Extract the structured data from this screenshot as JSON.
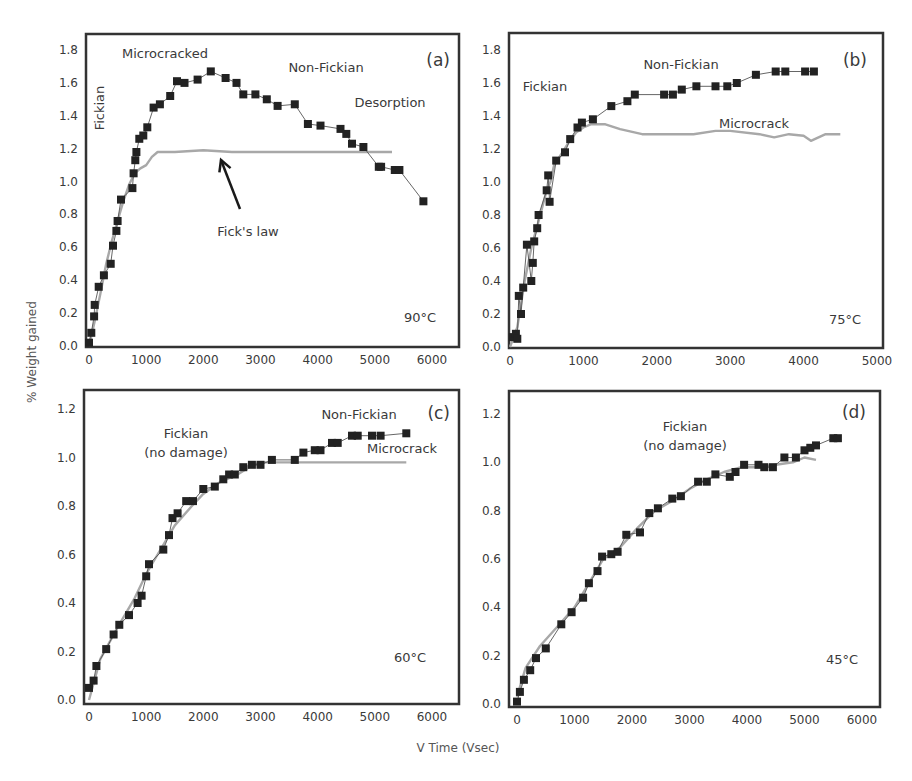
{
  "figure": {
    "ylabel": "% Weight gained",
    "xlabel": "V Time (Vsec)",
    "colors": {
      "data": "#222222",
      "fit": "#a8a8a8",
      "frame": "#333333",
      "text": "#3a3a3a"
    }
  },
  "chart_data": [
    {
      "type": "line",
      "panel": "(a)",
      "temperature": "90°C",
      "xlim": [
        0,
        6000
      ],
      "ylim": [
        0,
        1.8
      ],
      "xticks": [
        0,
        1000,
        2000,
        3000,
        4000,
        5000,
        6000
      ],
      "yticks": [
        0.0,
        0.2,
        0.4,
        0.6,
        0.8,
        1.0,
        1.2,
        1.4,
        1.6,
        1.8
      ],
      "annotations": [
        "Microcracked",
        "Non-Fickian",
        "Desorption",
        "Fickian",
        "Fick's law"
      ],
      "series": [
        {
          "name": "Experimental",
          "marker": "square",
          "x": [
            0,
            40,
            90,
            100,
            170,
            260,
            380,
            420,
            480,
            500,
            560,
            760,
            780,
            810,
            830,
            880,
            950,
            1020,
            1130,
            1240,
            1420,
            1540,
            1670,
            1900,
            2130,
            2390,
            2580,
            2700,
            2910,
            3110,
            3300,
            3600,
            3830,
            4050,
            4400,
            4500,
            4600,
            4800,
            5070,
            5110,
            5350,
            5430,
            5850
          ],
          "y": [
            0.02,
            0.08,
            0.18,
            0.25,
            0.36,
            0.43,
            0.5,
            0.61,
            0.7,
            0.76,
            0.89,
            0.96,
            1.05,
            1.13,
            1.18,
            1.26,
            1.28,
            1.33,
            1.45,
            1.47,
            1.52,
            1.61,
            1.6,
            1.62,
            1.67,
            1.63,
            1.6,
            1.53,
            1.53,
            1.5,
            1.46,
            1.47,
            1.35,
            1.34,
            1.32,
            1.29,
            1.23,
            1.21,
            1.09,
            1.09,
            1.07,
            1.07,
            0.88
          ]
        },
        {
          "name": "Fick's law",
          "marker": "none",
          "x": [
            0,
            100,
            200,
            300,
            400,
            500,
            600,
            700,
            800,
            900,
            1000,
            1100,
            1200,
            1500,
            2000,
            2500,
            3000,
            4000,
            5000,
            5300
          ],
          "y": [
            0.0,
            0.15,
            0.32,
            0.5,
            0.64,
            0.76,
            0.88,
            0.98,
            1.05,
            1.08,
            1.1,
            1.15,
            1.18,
            1.18,
            1.19,
            1.18,
            1.18,
            1.18,
            1.18,
            1.18
          ]
        }
      ]
    },
    {
      "type": "line",
      "panel": "(b)",
      "temperature": "75°C",
      "xlim": [
        0,
        5000
      ],
      "ylim": [
        0,
        1.8
      ],
      "xticks": [
        0,
        1000,
        2000,
        3000,
        4000,
        5000
      ],
      "yticks": [
        0.0,
        0.2,
        0.4,
        0.6,
        0.8,
        1.0,
        1.2,
        1.4,
        1.6,
        1.8
      ],
      "annotations": [
        "Fickian",
        "Non-Fickian",
        "Microcrack"
      ],
      "series": [
        {
          "name": "Experimental",
          "marker": "square",
          "x": [
            40,
            80,
            100,
            120,
            150,
            180,
            230,
            290,
            310,
            330,
            370,
            390,
            500,
            520,
            540,
            630,
            750,
            820,
            920,
            980,
            1130,
            1380,
            1600,
            1700,
            2100,
            2220,
            2340,
            2540,
            2800,
            2960,
            3090,
            3350,
            3620,
            3750,
            4020,
            4140
          ],
          "y": [
            0.06,
            0.08,
            0.05,
            0.31,
            0.2,
            0.36,
            0.62,
            0.4,
            0.51,
            0.64,
            0.72,
            0.8,
            0.95,
            1.04,
            0.88,
            1.13,
            1.18,
            1.26,
            1.33,
            1.36,
            1.38,
            1.46,
            1.49,
            1.53,
            1.53,
            1.53,
            1.56,
            1.58,
            1.58,
            1.58,
            1.6,
            1.65,
            1.67,
            1.67,
            1.67,
            1.67
          ]
        },
        {
          "name": "Fick's law",
          "marker": "none",
          "x": [
            0,
            100,
            200,
            300,
            400,
            500,
            550,
            600,
            700,
            800,
            900,
            1000,
            1100,
            1300,
            1500,
            1800,
            2000,
            2500,
            2800,
            3000,
            3400,
            3600,
            3800,
            4000,
            4100,
            4300,
            4500
          ],
          "y": [
            0.0,
            0.12,
            0.4,
            0.62,
            0.78,
            0.95,
            1.0,
            1.1,
            1.17,
            1.24,
            1.3,
            1.33,
            1.35,
            1.35,
            1.32,
            1.29,
            1.29,
            1.29,
            1.31,
            1.31,
            1.29,
            1.27,
            1.29,
            1.28,
            1.25,
            1.29,
            1.29
          ]
        }
      ]
    },
    {
      "type": "line",
      "panel": "(c)",
      "temperature": "60°C",
      "xlim": [
        0,
        6000
      ],
      "ylim": [
        0,
        1.2
      ],
      "xticks": [
        0,
        1000,
        2000,
        3000,
        4000,
        5000,
        6000
      ],
      "yticks": [
        0.0,
        0.2,
        0.4,
        0.6,
        0.8,
        1.0,
        1.2
      ],
      "annotations": [
        "Fickian (no damage)",
        "Non-Fickian",
        "Microcrack"
      ],
      "series": [
        {
          "name": "Experimental",
          "marker": "square",
          "x": [
            0,
            80,
            130,
            300,
            430,
            530,
            700,
            850,
            920,
            1000,
            1050,
            1300,
            1400,
            1460,
            1550,
            1700,
            1820,
            2000,
            2200,
            2350,
            2450,
            2550,
            2700,
            2850,
            3000,
            3200,
            3600,
            3750,
            3950,
            4050,
            4250,
            4350,
            4600,
            4700,
            4950,
            5100,
            5550
          ],
          "y": [
            0.05,
            0.08,
            0.14,
            0.21,
            0.27,
            0.31,
            0.35,
            0.4,
            0.43,
            0.51,
            0.56,
            0.62,
            0.68,
            0.75,
            0.77,
            0.82,
            0.82,
            0.87,
            0.88,
            0.91,
            0.93,
            0.93,
            0.96,
            0.97,
            0.97,
            0.99,
            0.99,
            1.02,
            1.03,
            1.03,
            1.06,
            1.06,
            1.09,
            1.09,
            1.09,
            1.09,
            1.1
          ]
        },
        {
          "name": "Fick's law",
          "marker": "none",
          "x": [
            0,
            200,
            500,
            800,
            1000,
            1200,
            1500,
            1800,
            2000,
            2300,
            2600,
            2800,
            3000,
            3500,
            4000,
            5000,
            5550
          ],
          "y": [
            0.0,
            0.17,
            0.3,
            0.42,
            0.52,
            0.6,
            0.72,
            0.8,
            0.85,
            0.9,
            0.93,
            0.96,
            0.98,
            0.98,
            0.98,
            0.98,
            0.98
          ]
        }
      ]
    },
    {
      "type": "line",
      "panel": "(d)",
      "temperature": "45°C",
      "xlim": [
        0,
        6000
      ],
      "ylim": [
        0,
        1.2
      ],
      "xticks": [
        0,
        1000,
        2000,
        3000,
        4000,
        5000,
        6000
      ],
      "yticks": [
        0.0,
        0.2,
        0.4,
        0.6,
        0.8,
        1.0,
        1.2
      ],
      "annotations": [
        "Fickian (no damage)"
      ],
      "series": [
        {
          "name": "Experimental",
          "marker": "square",
          "x": [
            0,
            50,
            120,
            230,
            330,
            500,
            770,
            950,
            1150,
            1250,
            1400,
            1480,
            1640,
            1750,
            1900,
            2140,
            2300,
            2450,
            2700,
            2850,
            3150,
            3300,
            3450,
            3700,
            3800,
            3950,
            4200,
            4300,
            4450,
            4650,
            4850,
            5000,
            5100,
            5200,
            5500,
            5580
          ],
          "y": [
            0.01,
            0.05,
            0.1,
            0.14,
            0.19,
            0.23,
            0.33,
            0.38,
            0.44,
            0.5,
            0.55,
            0.61,
            0.62,
            0.63,
            0.7,
            0.71,
            0.79,
            0.81,
            0.85,
            0.86,
            0.92,
            0.92,
            0.95,
            0.94,
            0.96,
            0.99,
            0.99,
            0.98,
            0.98,
            1.02,
            1.02,
            1.05,
            1.06,
            1.07,
            1.1,
            1.1
          ]
        },
        {
          "name": "Fick's law",
          "marker": "none",
          "x": [
            0,
            150,
            400,
            700,
            1000,
            1300,
            1500,
            1800,
            2100,
            2400,
            2700,
            3000,
            3300,
            3600,
            3900,
            4200,
            4500,
            4800,
            5000,
            5200
          ],
          "y": [
            0.03,
            0.15,
            0.24,
            0.32,
            0.4,
            0.52,
            0.6,
            0.65,
            0.73,
            0.8,
            0.84,
            0.89,
            0.93,
            0.96,
            0.98,
            0.98,
            0.99,
            1.0,
            1.02,
            1.01
          ]
        }
      ]
    }
  ],
  "panels_layout": [
    {
      "box": [
        86,
        34,
        459,
        347
      ],
      "xpx": [
        89,
        432
      ],
      "ypx": [
        346,
        50
      ],
      "labels": [
        {
          "text": "Microcracked",
          "x": 122,
          "y": 58,
          "anchor": "start",
          "rotate": 0
        },
        {
          "text": "Non-Fickian",
          "x": 326,
          "y": 72,
          "anchor": "middle",
          "rotate": 0
        },
        {
          "text": "Desorption",
          "x": 390,
          "y": 107,
          "anchor": "middle",
          "rotate": 0
        },
        {
          "text": "Fickian",
          "x": 104,
          "y": 108,
          "anchor": "middle",
          "rotate": -90
        },
        {
          "text": "Fick's law",
          "x": 248,
          "y": 236,
          "anchor": "middle",
          "rotate": 0
        }
      ],
      "panel_label": {
        "x": 450,
        "y": 66
      },
      "temp_label": {
        "x": 436,
        "y": 322
      },
      "arrow": {
        "from": [
          240,
          209
        ],
        "to": [
          221,
          160
        ]
      }
    },
    {
      "box": [
        509,
        33,
        883,
        348
      ],
      "xpx": [
        510,
        877
      ],
      "ypx": [
        347,
        50
      ],
      "labels": [
        {
          "text": "Fickian",
          "x": 545,
          "y": 91,
          "anchor": "middle",
          "rotate": 0
        },
        {
          "text": "Non-Fickian",
          "x": 681,
          "y": 69,
          "anchor": "middle",
          "rotate": 0
        },
        {
          "text": "Microcrack",
          "x": 754,
          "y": 128,
          "anchor": "middle",
          "rotate": 0
        }
      ],
      "panel_label": {
        "x": 867,
        "y": 66
      },
      "temp_label": {
        "x": 861,
        "y": 324
      }
    },
    {
      "box": [
        84,
        390,
        459,
        704
      ],
      "xpx": [
        89,
        432
      ],
      "ypx": [
        700,
        409
      ],
      "labels": [
        {
          "text": "Fickian",
          "x": 186,
          "y": 438,
          "anchor": "middle",
          "rotate": 0
        },
        {
          "text": "(no damage)",
          "x": 186,
          "y": 457,
          "anchor": "middle",
          "rotate": 0
        },
        {
          "text": "Non-Fickian",
          "x": 359,
          "y": 419,
          "anchor": "middle",
          "rotate": 0
        },
        {
          "text": "Microcrack",
          "x": 402,
          "y": 453,
          "anchor": "middle",
          "rotate": 0
        }
      ],
      "panel_label": {
        "x": 450,
        "y": 419
      },
      "temp_label": {
        "x": 426,
        "y": 662
      }
    },
    {
      "box": [
        509,
        391,
        880,
        707
      ],
      "xpx": [
        517,
        862
      ],
      "ypx": [
        704,
        414
      ],
      "labels": [
        {
          "text": "Fickian",
          "x": 685,
          "y": 431,
          "anchor": "middle",
          "rotate": 0
        },
        {
          "text": "(no damage)",
          "x": 685,
          "y": 450,
          "anchor": "middle",
          "rotate": 0
        }
      ],
      "panel_label": {
        "x": 866,
        "y": 418
      },
      "temp_label": {
        "x": 858,
        "y": 664
      }
    }
  ]
}
